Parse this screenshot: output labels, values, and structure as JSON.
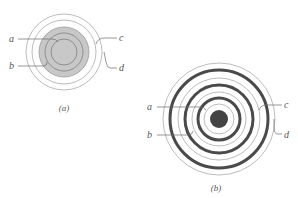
{
  "figure": {
    "panels": [
      {
        "id": "a",
        "caption": "(a)",
        "center": [
          64,
          52
        ],
        "colors": {
          "disk": "#c8c8c8",
          "ring": "#b4b4b4"
        },
        "labels": {
          "a": "a",
          "b": "b",
          "c": "c",
          "d": "d"
        }
      },
      {
        "id": "b",
        "caption": "(b)",
        "center": [
          219,
          119
        ],
        "colors": {
          "dot": "#444444",
          "thick_ring": "#4a4a4a",
          "thin_ring": "#b4b4b4"
        },
        "labels": {
          "a": "a",
          "b": "b",
          "c": "c",
          "d": "d"
        }
      }
    ]
  }
}
